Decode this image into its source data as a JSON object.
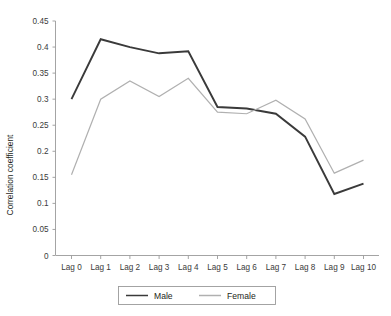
{
  "chart_data": {
    "type": "line",
    "title": "",
    "xlabel": "",
    "ylabel": "Correlation coefficient",
    "categories": [
      "Lag 0",
      "Lag 1",
      "Lag 2",
      "Lag 3",
      "Lag 4",
      "Lag 5",
      "Lag 6",
      "Lag 7",
      "Lag 8",
      "Lag 9",
      "Lag 10"
    ],
    "ylim": [
      0,
      0.45
    ],
    "yticks": [
      0,
      0.05,
      0.1,
      0.15,
      0.2,
      0.25,
      0.3,
      0.35,
      0.4,
      0.45
    ],
    "ytick_labels": [
      "0",
      "0.05",
      "0.1",
      "0.15",
      "0.2",
      "0.25",
      "0.3",
      "0.35",
      "0.4",
      "0.45"
    ],
    "grid": false,
    "legend_position": "bottom",
    "series": [
      {
        "name": "Male",
        "color": "#3a3a3a",
        "values": [
          0.3,
          0.415,
          0.4,
          0.388,
          0.392,
          0.285,
          0.282,
          0.272,
          0.228,
          0.118,
          0.138
        ]
      },
      {
        "name": "Female",
        "color": "#b0b0b0",
        "values": [
          0.155,
          0.3,
          0.335,
          0.305,
          0.34,
          0.275,
          0.272,
          0.298,
          0.262,
          0.158,
          0.183
        ]
      }
    ]
  },
  "legend": {
    "items": [
      {
        "label": "Male"
      },
      {
        "label": "Female"
      }
    ]
  },
  "colors": {
    "male": "#3a3a3a",
    "female": "#b0b0b0",
    "axis": "#9a9a9a",
    "text": "#231f20"
  }
}
